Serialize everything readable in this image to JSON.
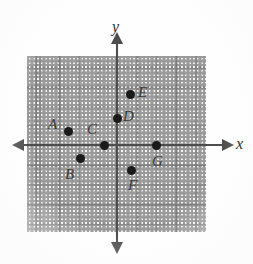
{
  "figure": {
    "type": "coordinate-plane",
    "width": 253,
    "height": 264,
    "background_color": "#ffffff",
    "grid_fill_color": "#f4f4f2",
    "grid_major_color": "#787878",
    "grid_minor_color": "#bdbdbd",
    "axis_color": "#4d4d4d",
    "point_color": "#1a1a1a",
    "label_color": "#3a3a3a"
  },
  "axes": {
    "x_label": "x",
    "y_label": "y",
    "x_label_pos": {
      "left": 236,
      "top": 136
    },
    "y_label_pos": {
      "left": 112,
      "top": 19
    },
    "origin": {
      "x": 117,
      "y": 145
    },
    "major_spacing_px": 19.5,
    "x_axis_extent_px": [
      18,
      228
    ],
    "y_axis_extent_px": [
      36,
      250
    ],
    "arrowheads": [
      "left",
      "right",
      "up",
      "down"
    ]
  },
  "chart_data": {
    "type": "scatter",
    "title": "",
    "xlabel": "x",
    "ylabel": "y",
    "grid": true,
    "legend": false,
    "xlim": [
      -4.6,
      4.6
    ],
    "ylim": [
      -4.5,
      4.5
    ],
    "major_tick_step": 1,
    "minor_subdivisions": 2,
    "point_labels": [
      "A",
      "B",
      "C",
      "D",
      "E",
      "F",
      "G"
    ],
    "points": [
      {
        "label": "A",
        "x": -2.5,
        "y": 0.7,
        "px": 68,
        "py": 131,
        "label_dx": -20,
        "label_dy": -14
      },
      {
        "label": "B",
        "x": -1.9,
        "y": -0.7,
        "px": 80,
        "py": 158,
        "label_dx": -15,
        "label_dy": 9
      },
      {
        "label": "C",
        "x": -0.7,
        "y": 0.0,
        "px": 104,
        "py": 145,
        "label_dx": -17,
        "label_dy": -23
      },
      {
        "label": "D",
        "x": 0.0,
        "y": 1.4,
        "px": 117,
        "py": 118,
        "label_dx": 6,
        "label_dy": -9
      },
      {
        "label": "E",
        "x": 0.7,
        "y": 2.6,
        "px": 130,
        "py": 94,
        "label_dx": 8,
        "label_dy": -9
      },
      {
        "label": "F",
        "x": 0.7,
        "y": -1.3,
        "px": 131,
        "py": 170,
        "label_dx": -3,
        "label_dy": 8
      },
      {
        "label": "G",
        "x": 1.9,
        "y": 0.0,
        "px": 156,
        "py": 145,
        "label_dx": -4,
        "label_dy": 9
      }
    ]
  }
}
